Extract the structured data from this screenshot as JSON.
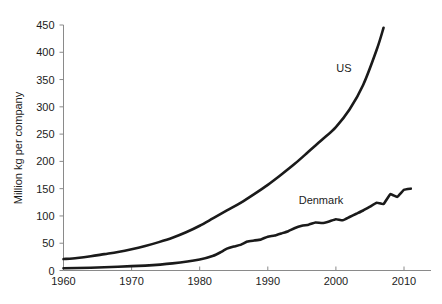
{
  "chart_data": {
    "type": "line",
    "title": "",
    "xlabel": "",
    "ylabel": "Million kg per company",
    "xlim": [
      1960,
      2012
    ],
    "ylim": [
      0,
      450
    ],
    "grid": false,
    "legend_position": "inline-annotations",
    "x_ticks": [
      1960,
      1970,
      1980,
      1990,
      2000,
      2010
    ],
    "x_tick_labels": [
      "1960",
      "1970",
      "1980",
      "1990",
      "2000",
      "2010"
    ],
    "y_ticks": [
      0,
      50,
      100,
      150,
      200,
      250,
      300,
      350,
      400,
      450
    ],
    "y_tick_labels": [
      "0",
      "50",
      "100",
      "150",
      "200",
      "250",
      "300",
      "350",
      "400",
      "450"
    ],
    "series": [
      {
        "name": "US",
        "label": "US",
        "color": "#1a1a1a",
        "x": [
          1960,
          1962,
          1964,
          1966,
          1968,
          1970,
          1972,
          1974,
          1976,
          1978,
          1980,
          1982,
          1984,
          1986,
          1988,
          1990,
          1992,
          1994,
          1996,
          1998,
          2000,
          2002,
          2004,
          2006,
          2007
        ],
        "values": [
          21,
          23,
          26,
          30,
          34,
          39,
          45,
          52,
          60,
          70,
          82,
          96,
          110,
          124,
          140,
          157,
          176,
          196,
          218,
          240,
          263,
          295,
          340,
          405,
          445
        ]
      },
      {
        "name": "Denmark",
        "label": "Denmark",
        "color": "#1a1a1a",
        "x": [
          1960,
          1964,
          1968,
          1972,
          1976,
          1980,
          1982,
          1983,
          1984,
          1985,
          1986,
          1987,
          1988,
          1989,
          1990,
          1991,
          1992,
          1993,
          1994,
          1995,
          1996,
          1997,
          1998,
          1999,
          2000,
          2001,
          2002,
          2003,
          2004,
          2005,
          2006,
          2007,
          2008,
          2009,
          2010,
          2011
        ],
        "values": [
          4,
          5,
          7,
          9,
          13,
          20,
          27,
          33,
          40,
          44,
          47,
          53,
          55,
          57,
          62,
          64,
          68,
          72,
          78,
          82,
          84,
          88,
          87,
          90,
          94,
          92,
          98,
          104,
          110,
          117,
          124,
          122,
          140,
          135,
          148,
          150
        ]
      }
    ],
    "annotations": [
      {
        "text": "US",
        "x": 2001,
        "y": 370
      },
      {
        "text": "Denmark",
        "x": 1995,
        "y": 190
      }
    ]
  }
}
